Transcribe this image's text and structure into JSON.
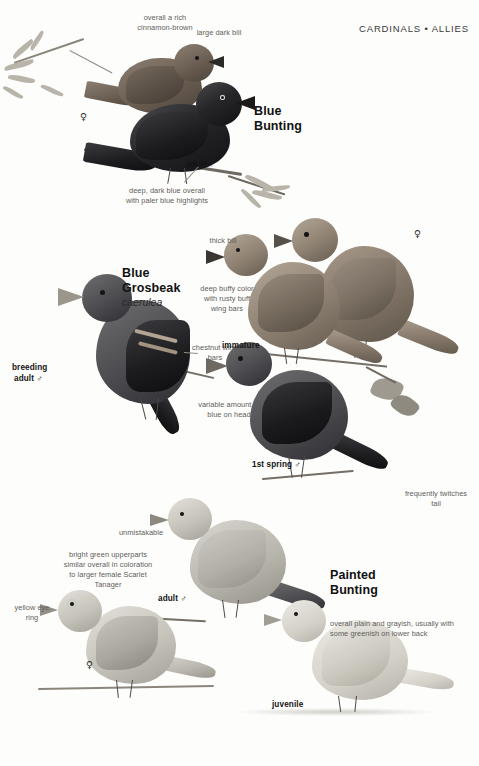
{
  "page": {
    "header": "CARDINALS • ALLIES",
    "width": 479,
    "height": 766,
    "style": "grayscale bird field guide plate"
  },
  "species": [
    {
      "id": "blue-bunting",
      "common_name_line1": "Blue",
      "common_name_line2": "Bunting",
      "scientific_name": "",
      "annotations": [
        {
          "id": "cinnamon",
          "text": "overall a rich cinnamon-brown"
        },
        {
          "id": "large-bill",
          "text": "large dark bill"
        },
        {
          "id": "deep-blue",
          "text": "deep, dark blue overall with paler blue highlights"
        }
      ],
      "labels": [
        {
          "id": "female",
          "text": "♀"
        },
        {
          "id": "adult-male",
          "text": "adult ♂"
        }
      ]
    },
    {
      "id": "blue-grosbeak",
      "common_name_line1": "Blue",
      "common_name_line2": "Grosbeak",
      "scientific_name": "caerulea",
      "annotations": [
        {
          "id": "thick-bill",
          "text": "thick bill"
        },
        {
          "id": "buffy",
          "text": "deep buffy color with rusty buff wing bars"
        },
        {
          "id": "chestnut",
          "text": "chestnut wing bars"
        },
        {
          "id": "variable-blue",
          "text": "variable amount of blue on head"
        },
        {
          "id": "twitch",
          "text": "frequently twitches tail"
        }
      ],
      "labels": [
        {
          "id": "female",
          "text": "♀"
        },
        {
          "id": "immature",
          "text": "immature"
        },
        {
          "id": "breeding-adult-male-line1",
          "text": "breeding"
        },
        {
          "id": "breeding-adult-male-line2",
          "text": "adult ♂"
        },
        {
          "id": "first-spring-male",
          "text": "1st spring ♂"
        }
      ]
    },
    {
      "id": "painted-bunting",
      "common_name_line1": "Painted",
      "common_name_line2": "Bunting",
      "scientific_name": "",
      "annotations": [
        {
          "id": "unmistakable",
          "text": "unmistakable"
        },
        {
          "id": "bright-green",
          "text": "bright green upperparts similar overall in coloration to larger female Scarlet Tanager"
        },
        {
          "id": "yellow-eye-ring",
          "text": "yellow eye ring"
        },
        {
          "id": "plain-grayish",
          "text": "overall plain and grayish, usually with some greenish on lower back"
        }
      ],
      "labels": [
        {
          "id": "adult-male",
          "text": "adult ♂"
        },
        {
          "id": "female",
          "text": "♀"
        },
        {
          "id": "juvenile",
          "text": "juvenile"
        }
      ]
    }
  ]
}
